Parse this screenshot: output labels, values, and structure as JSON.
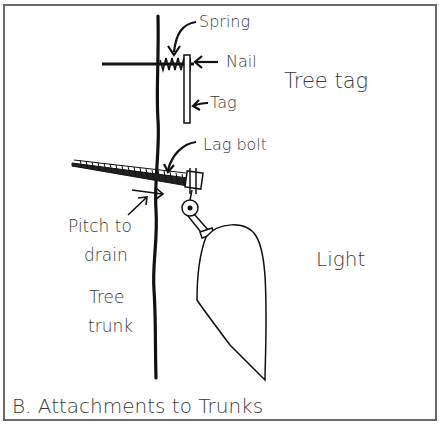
{
  "diagram": {
    "caption": "B. Attachments to Trunks",
    "labels": {
      "spring": "Spring",
      "nail": "Nail",
      "tag": "Tag",
      "tree_tag": "Tree tag",
      "lag_bolt": "Lag bolt",
      "pitch_line1": "Pitch to",
      "pitch_line2": "drain",
      "tree_line1": "Tree",
      "tree_line2": "trunk",
      "light": "Light"
    },
    "colors": {
      "ink": "#111111",
      "label": "#3a3a3a",
      "frame": "#6a6a6a",
      "background": "#ffffff"
    }
  }
}
